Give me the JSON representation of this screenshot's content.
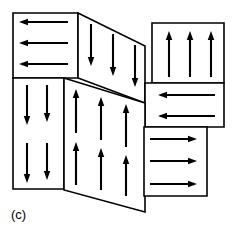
{
  "figure": {
    "caption": "(c)",
    "caption_position": {
      "x": 11,
      "y": 219
    },
    "width": 234,
    "height": 236,
    "background_color": "#ffffff",
    "line_color": "#000000",
    "fill_color": "#ffffff"
  },
  "regions": [
    {
      "id": "top-left-region",
      "name": "top-left-region",
      "shape": "rectangle",
      "arrow_direction": "left",
      "arrow_count": 3,
      "points": "13,13 78,13 78,78 13,78"
    },
    {
      "id": "top-middle-region",
      "name": "top-middle-slanted-region",
      "shape": "parallelogram",
      "arrow_direction": "down",
      "arrow_count": 3,
      "points": "78,13 145,46 145,103 78,78"
    },
    {
      "id": "top-right-region",
      "name": "top-right-region",
      "shape": "rectangle",
      "arrow_direction": "up",
      "arrow_count": 3,
      "points": "152,23 224,23 224,83 152,83"
    },
    {
      "id": "middle-right-region",
      "name": "middle-right-region",
      "shape": "rectangle",
      "arrow_direction": "left",
      "arrow_count": 2,
      "points": "145,83 224,83 224,127 145,127"
    },
    {
      "id": "bottom-left-region",
      "name": "bottom-left-region",
      "shape": "rectangle",
      "arrow_direction": "down",
      "arrow_count": 4,
      "points": "13,78 64,78 64,189 13,189"
    },
    {
      "id": "center-region",
      "name": "center-slanted-region",
      "shape": "quadrilateral",
      "arrow_direction": "up",
      "arrow_count": 6,
      "points": "64,78 145,103 145,212 64,190"
    },
    {
      "id": "bottom-right-region",
      "name": "bottom-right-region",
      "shape": "rectangle",
      "arrow_direction": "right",
      "arrow_count": 3,
      "points": "144,127 207,127 207,196 144,196"
    }
  ],
  "arrows": {
    "top_left": [
      {
        "x1": 68,
        "y1": 22,
        "x2": 19,
        "y2": 22,
        "dir": "left"
      },
      {
        "x1": 68,
        "y1": 43,
        "x2": 19,
        "y2": 43,
        "dir": "left"
      },
      {
        "x1": 68,
        "y1": 64,
        "x2": 19,
        "y2": 64,
        "dir": "left"
      }
    ],
    "top_middle": [
      {
        "x1": 91,
        "y1": 24,
        "x2": 91,
        "y2": 66,
        "dir": "down"
      },
      {
        "x1": 113,
        "y1": 34,
        "x2": 113,
        "y2": 76,
        "dir": "down"
      },
      {
        "x1": 135,
        "y1": 45,
        "x2": 135,
        "y2": 87,
        "dir": "down"
      }
    ],
    "top_right": [
      {
        "x1": 169,
        "y1": 77,
        "x2": 169,
        "y2": 31,
        "dir": "up"
      },
      {
        "x1": 190,
        "y1": 77,
        "x2": 190,
        "y2": 31,
        "dir": "up"
      },
      {
        "x1": 211,
        "y1": 77,
        "x2": 211,
        "y2": 31,
        "dir": "up"
      }
    ],
    "middle_right": [
      {
        "x1": 215,
        "y1": 95,
        "x2": 158,
        "y2": 95,
        "dir": "left"
      },
      {
        "x1": 215,
        "y1": 116,
        "x2": 158,
        "y2": 116,
        "dir": "left"
      }
    ],
    "bottom_left": [
      {
        "x1": 27,
        "y1": 85,
        "x2": 27,
        "y2": 125,
        "dir": "down"
      },
      {
        "x1": 47,
        "y1": 85,
        "x2": 47,
        "y2": 122,
        "dir": "down"
      },
      {
        "x1": 27,
        "y1": 143,
        "x2": 27,
        "y2": 183,
        "dir": "down"
      },
      {
        "x1": 47,
        "y1": 143,
        "x2": 47,
        "y2": 180,
        "dir": "down"
      }
    ],
    "center": [
      {
        "x1": 76,
        "y1": 133,
        "x2": 76,
        "y2": 89,
        "dir": "up"
      },
      {
        "x1": 101,
        "y1": 140,
        "x2": 101,
        "y2": 97,
        "dir": "up"
      },
      {
        "x1": 126,
        "y1": 147,
        "x2": 126,
        "y2": 104,
        "dir": "up"
      },
      {
        "x1": 76,
        "y1": 185,
        "x2": 76,
        "y2": 142,
        "dir": "up"
      },
      {
        "x1": 101,
        "y1": 190,
        "x2": 101,
        "y2": 148,
        "dir": "up"
      },
      {
        "x1": 126,
        "y1": 196,
        "x2": 126,
        "y2": 155,
        "dir": "up"
      }
    ],
    "bottom_right": [
      {
        "x1": 150,
        "y1": 139,
        "x2": 197,
        "y2": 139,
        "dir": "right"
      },
      {
        "x1": 150,
        "y1": 161,
        "x2": 197,
        "y2": 161,
        "dir": "right"
      },
      {
        "x1": 150,
        "y1": 184,
        "x2": 197,
        "y2": 184,
        "dir": "right"
      }
    ]
  }
}
